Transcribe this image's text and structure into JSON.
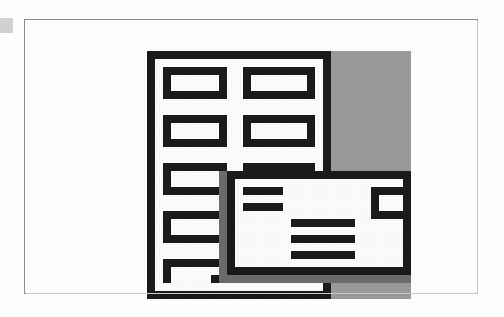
{
  "figure": {
    "kind": "pixelated-screenshot-bitmap",
    "caption": ""
  },
  "edge_marker": {
    "label": "page-edge-marker",
    "color": "#d2d2d2"
  },
  "frame": {
    "border_color": "#8d8f91",
    "fill_color": "#fefefe"
  },
  "mosaic": {
    "cell_width": 8,
    "cell_height": 8,
    "columns": 33,
    "rows": 31,
    "palette": {
      "K": "#1a1a1a",
      "W": "#fbfbfb",
      "G": "#9a9a9a",
      "D": "#6b6b6b",
      "L": "#c4c4c4"
    },
    "palette_names": {
      "K": "black-ink",
      "W": "white-paper",
      "G": "gray-desktop",
      "D": "dark-gray-shadow",
      "L": "light-gray-edge"
    },
    "legend": [
      {
        "key": "K",
        "name": "black-ink",
        "hex": "#1a1a1a"
      },
      {
        "key": "W",
        "name": "white-paper",
        "hex": "#fbfbfb"
      },
      {
        "key": "G",
        "name": "gray-desktop",
        "hex": "#9a9a9a"
      },
      {
        "key": "D",
        "name": "dark-gray-shadow",
        "hex": "#6b6b6b"
      },
      {
        "key": "L",
        "name": "light-gray-edge",
        "hex": "#c4c4c4"
      }
    ],
    "pixels": [
      "KKKKKKKKKKKKKKKKKKKKKKKGGGGGGGGGG",
      "KWWWWWWWWWWWWWWWWWWWWWKGGGGGGGGGG",
      "KWKKKKKKKKWWKKKKKKKKKWKGGGGGGGGGG",
      "KWKWWWWWWKWWKWWWWWWWKWKGGGGGGGGGG",
      "KWKWWWWWWKWWKWWWWWWWKWKGGGGGGGGGG",
      "KWKKKKKKKKWWKKKKKKKKKWKGGGGGGGGGG",
      "KWWWWWWWWWWWWWWWWWWWWWKGGGGGGGGGG",
      "KWWWWWWWWWWWWWWWWWWWWWKGGGGGGGGGG",
      "KWKKKKKKKKWWKKKKKKKKKWKGGGGGGGGGG",
      "KWKWWWWWWKWWKWWWWWWWKWKGGGGGGGGGG",
      "KWKWWWWWWKWWKWWWWWWWKWKGGGGGGGGGG",
      "KWKKKKKKKKWWKKKKKKKKKWKGGGGGGGGGG",
      "KWWWWWWWWWWWWWWWWWWWWWKGGGGGGGGGG",
      "KWWWWWWWWWWWWWWWWWWWWWKGGGGGGGGGG",
      "KWKKKKKKKKWWKKKKKKKKKWKGGGGGGGGGG",
      "KWKWWWWWWDKKKKKKKKKKKKKKKKKKKKKKK",
      "KWKWWWWWWDKWWWWWWWWWWWWWWWWWWWWWK",
      "KWKKKKKKKDKWKKKKKWWWWWWWWWWWKKKKK",
      "KWWWWWWWWDKWWWWWWWWWWWWWWWWWKWWWK",
      "KWWWWWWWWDKWKKKKKWWWWWWWWWWWKWWWK",
      "KWKKKKKKKDKWWWWWWWWWWWWWWWWWKKKKK",
      "KWKWWWWWWDKWWWWWWWKKKKKKKKWWWWWWK",
      "KWKWWWWWWDKWWWWWWWWWWWWWWWWWWWWWK",
      "KWKKKKKKKDKWWWWWWWKKKKKKKKWWWWWWK",
      "KWWWWWWWWDKWWWWWWWWWWWWWWWWWWWWWK",
      "KWWWWWWWWDKWWWWWWWKKKKKKKKWWWWWWK",
      "KWKKKKKKKDKWWWWWWWWWWWWWWWWWWWWWK",
      "KWKWWWWWWDKKKKKKKKKKKKKKKKKKKKKKK",
      "KWKWWWWWKDDDDDDDDDDDDDDDDDDDDDDDD",
      "KWWWWWWWWWWWWWWWWWWWWWKGGGGGGGGGG",
      "KKKKKKKKKKKKKKKKKKKKKKKGGGGGGGGGG"
    ]
  }
}
